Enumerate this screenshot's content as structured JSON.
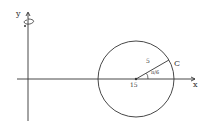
{
  "diagram": {
    "axes": {
      "x_label": "x",
      "y_label": "y",
      "rotation_arrow": "rotation-about-y-axis"
    },
    "circle": {
      "label": "C",
      "center_label": "15",
      "radius_label": "5",
      "angle_label": "π/6",
      "center": [
        15,
        0
      ],
      "radius": 5
    },
    "colors": {
      "stroke": "#333333",
      "background": "#ffffff"
    }
  }
}
